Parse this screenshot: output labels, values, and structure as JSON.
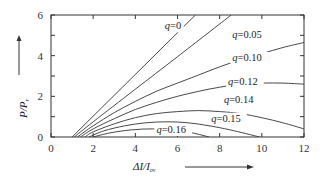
{
  "chart_data": {
    "type": "line",
    "title": "",
    "xlabel": "ΔI/I_ov",
    "xlabel_main": "ΔI/I",
    "xlabel_sub": "ov",
    "ylabel": "P/P_r",
    "ylabel_main": "P/P",
    "ylabel_sub": "r",
    "xlim": [
      0,
      12
    ],
    "ylim": [
      0,
      6
    ],
    "xticks": [
      0,
      2,
      4,
      6,
      8,
      10,
      12
    ],
    "yticks": [
      0,
      2,
      4,
      6
    ],
    "grid": false,
    "legend": "inline labels",
    "series": [
      {
        "name": "q=0",
        "label": "q=0",
        "label_pos": [
          5.4,
          5.3
        ],
        "points": [
          [
            1.0,
            0
          ],
          [
            6.85,
            6
          ]
        ]
      },
      {
        "name": "q=0.05",
        "label": "q=0.05",
        "label_pos": [
          8.6,
          4.85
        ],
        "points": [
          [
            1.1,
            0
          ],
          [
            2,
            0.75
          ],
          [
            4,
            2.35
          ],
          [
            6,
            3.95
          ],
          [
            8.55,
            6
          ]
        ]
      },
      {
        "name": "q=0.10",
        "label": "q=0.10",
        "label_pos": [
          8.6,
          3.75
        ],
        "points": [
          [
            1.25,
            0
          ],
          [
            2,
            0.55
          ],
          [
            3,
            1.2
          ],
          [
            4,
            1.75
          ],
          [
            5,
            2.25
          ],
          [
            6,
            2.65
          ],
          [
            7,
            3.05
          ],
          [
            8,
            3.45
          ],
          [
            9,
            3.8
          ],
          [
            10,
            4.1
          ],
          [
            11,
            4.4
          ],
          [
            12,
            4.65
          ]
        ]
      },
      {
        "name": "q=0.12",
        "label": "q=0.12",
        "label_pos": [
          8.4,
          2.55
        ],
        "points": [
          [
            1.4,
            0
          ],
          [
            2,
            0.4
          ],
          [
            3,
            0.9
          ],
          [
            4,
            1.35
          ],
          [
            5,
            1.7
          ],
          [
            6,
            2.0
          ],
          [
            7,
            2.25
          ],
          [
            8,
            2.45
          ],
          [
            9,
            2.6
          ],
          [
            10,
            2.65
          ],
          [
            11,
            2.65
          ],
          [
            12,
            2.6
          ]
        ]
      },
      {
        "name": "q=0.14",
        "label": "q=0.14",
        "label_pos": [
          8.2,
          1.65
        ],
        "points": [
          [
            1.6,
            0
          ],
          [
            2,
            0.25
          ],
          [
            3,
            0.65
          ],
          [
            4,
            0.95
          ],
          [
            5,
            1.15
          ],
          [
            6,
            1.25
          ],
          [
            7,
            1.3
          ],
          [
            8,
            1.25
          ],
          [
            9,
            1.15
          ],
          [
            10,
            0.95
          ],
          [
            11,
            0.7
          ],
          [
            12,
            0.4
          ]
        ]
      },
      {
        "name": "q=0.15",
        "label": "q=0.15",
        "label_pos": [
          7.6,
          0.75
        ],
        "points": [
          [
            1.8,
            0
          ],
          [
            2.5,
            0.3
          ],
          [
            3.5,
            0.55
          ],
          [
            4.5,
            0.7
          ],
          [
            5.5,
            0.75
          ],
          [
            6.5,
            0.7
          ],
          [
            7.5,
            0.55
          ],
          [
            8.5,
            0.35
          ],
          [
            9.9,
            0
          ]
        ]
      },
      {
        "name": "q=0.16",
        "label": "q=0.16",
        "label_pos": [
          5.0,
          0.2
        ],
        "points": [
          [
            2.0,
            0
          ],
          [
            2.8,
            0.2
          ],
          [
            3.8,
            0.35
          ],
          [
            4.8,
            0.4
          ],
          [
            5.8,
            0.35
          ],
          [
            6.7,
            0.2
          ],
          [
            7.5,
            0
          ]
        ]
      }
    ],
    "arrows": {
      "y": {
        "from": [
          25,
          75
        ],
        "to": [
          25,
          38
        ]
      },
      "x": {
        "from": [
          185,
          173
        ],
        "to": [
          250,
          173
        ]
      }
    }
  }
}
